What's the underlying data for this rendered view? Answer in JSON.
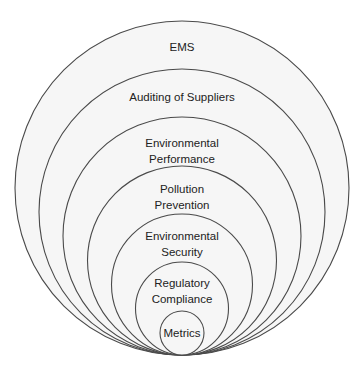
{
  "diagram": {
    "type": "nested-circles",
    "background": "#ffffff",
    "fill_color": "#f6f6f6",
    "stroke_color": "#4a4a4a",
    "layers": [
      {
        "label_lines": [
          "EMS"
        ]
      },
      {
        "label_lines": [
          "Auditing of Suppliers"
        ]
      },
      {
        "label_lines": [
          "Environmental",
          "Performance"
        ]
      },
      {
        "label_lines": [
          "Pollution",
          "Prevention"
        ]
      },
      {
        "label_lines": [
          "Environmental",
          "Security"
        ]
      },
      {
        "label_lines": [
          "Regulatory",
          "Compliance"
        ]
      },
      {
        "label_lines": [
          "Metrics"
        ]
      }
    ]
  }
}
